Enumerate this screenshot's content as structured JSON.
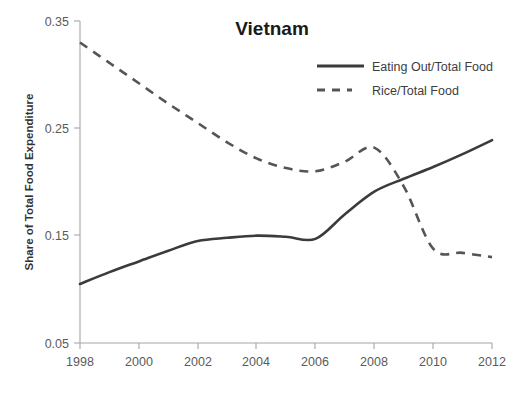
{
  "chart_data": {
    "type": "line",
    "title": "Vietnam",
    "xlabel": "",
    "ylabel": "Share of Total Food Expenditure",
    "xlim": [
      1998,
      2012
    ],
    "ylim": [
      0.05,
      0.35
    ],
    "xticks": [
      "1998",
      "2000",
      "2002",
      "2004",
      "2006",
      "2008",
      "2010",
      "2012"
    ],
    "yticks": [
      "0.35",
      "0.25",
      "0.15",
      "0.05"
    ],
    "grid": false,
    "legend_position": "top-right",
    "x": [
      1998,
      1999,
      2000,
      2001,
      2002,
      2003,
      2004,
      2005,
      2006,
      2007,
      2008,
      2009,
      2010,
      2011,
      2012
    ],
    "series": [
      {
        "name": "Eating Out/Total Food",
        "style": "solid",
        "color": "#3b3b3b",
        "values": [
          0.105,
          0.116,
          0.126,
          0.136,
          0.145,
          0.148,
          0.15,
          0.149,
          0.147,
          0.17,
          0.191,
          0.203,
          0.214,
          0.226,
          0.239
        ]
      },
      {
        "name": "Rice/Total Food",
        "style": "dashed",
        "color": "#555555",
        "values": [
          0.33,
          0.311,
          0.292,
          0.273,
          0.255,
          0.237,
          0.222,
          0.213,
          0.21,
          0.219,
          0.232,
          0.196,
          0.138,
          0.134,
          0.13
        ]
      }
    ]
  },
  "legend": {
    "items": [
      {
        "label": "Eating Out/Total Food"
      },
      {
        "label": "Rice/Total Food"
      }
    ]
  },
  "axes": {
    "y_title": "Share of Total Food Expenditure",
    "y_ticks": [
      {
        "label": "0.35"
      },
      {
        "label": "0.25"
      },
      {
        "label": "0.15"
      },
      {
        "label": "0.05"
      }
    ],
    "x_ticks": [
      {
        "label": "1998"
      },
      {
        "label": "2000"
      },
      {
        "label": "2002"
      },
      {
        "label": "2004"
      },
      {
        "label": "2006"
      },
      {
        "label": "2008"
      },
      {
        "label": "2010"
      },
      {
        "label": "2012"
      }
    ]
  },
  "header": {
    "title": "Vietnam"
  },
  "colors": {
    "solid_series": "#3b3b3b",
    "dashed_series": "#555555",
    "axis": "#a6a6a6",
    "text": "#404040",
    "background": "#ffffff"
  }
}
